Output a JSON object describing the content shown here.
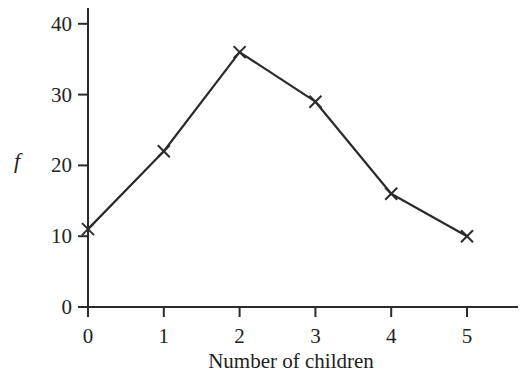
{
  "chart_data": {
    "type": "line",
    "title": "",
    "xlabel": "Number of children",
    "ylabel": "f",
    "x": [
      0,
      1,
      2,
      3,
      4,
      5
    ],
    "categories": [
      "0",
      "1",
      "2",
      "3",
      "4",
      "5"
    ],
    "series": [
      {
        "name": "f",
        "values": [
          11,
          22,
          36,
          29,
          16,
          10
        ],
        "marker": "x"
      }
    ],
    "xlim": [
      0,
      5.6
    ],
    "ylim": [
      0,
      42
    ],
    "yticks": [
      0,
      10,
      20,
      30,
      40
    ],
    "xticks": [
      0,
      1,
      2,
      3,
      4,
      5
    ],
    "grid": false,
    "legend": "none"
  },
  "colors": {
    "line": "#2b2b2b",
    "axis": "#2b2b2b",
    "text": "#222222"
  }
}
